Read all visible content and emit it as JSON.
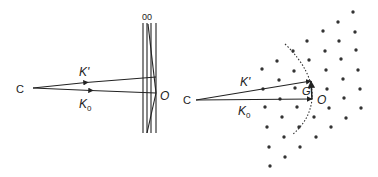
{
  "figure": {
    "left_panel": {
      "name": "real-space plane wave reflection",
      "labels": {
        "source": "C",
        "k_prime": "K'",
        "k_zero": "K",
        "k_zero_sub": "0",
        "origin": "O",
        "planes": "00"
      },
      "source_point": [
        33,
        88
      ],
      "k_prime_end": [
        156,
        77
      ],
      "k_zero_end": [
        156,
        93
      ],
      "vertical_planes_x": [
        143,
        147,
        151,
        156
      ],
      "planes_y_range": [
        23,
        133
      ]
    },
    "right_panel": {
      "name": "Ewald sphere construction in reciprocal lattice",
      "labels": {
        "source": "C",
        "k_prime": "K'",
        "k_zero": "K",
        "k_zero_sub": "0",
        "origin": "O",
        "g_vector": "G"
      },
      "source_point": [
        196,
        100
      ],
      "k_prime_end": [
        311,
        81
      ],
      "origin_point": [
        312,
        99
      ],
      "lattice_points": [
        [
          353,
          12
        ],
        [
          338,
          22
        ],
        [
          323,
          31
        ],
        [
          355,
          32
        ],
        [
          307,
          41
        ],
        [
          339,
          41
        ],
        [
          293,
          51
        ],
        [
          325,
          51
        ],
        [
          356,
          50
        ],
        [
          277,
          61
        ],
        [
          309,
          60
        ],
        [
          341,
          59
        ],
        [
          262,
          69
        ],
        [
          294,
          71
        ],
        [
          326,
          70
        ],
        [
          358,
          70
        ],
        [
          279,
          80
        ],
        [
          343,
          79
        ],
        [
          295,
          88
        ],
        [
          327,
          89
        ],
        [
          360,
          89
        ],
        [
          263,
          89
        ],
        [
          280,
          99
        ],
        [
          344,
          98
        ],
        [
          265,
          107
        ],
        [
          297,
          107
        ],
        [
          329,
          108
        ],
        [
          361,
          108
        ],
        [
          282,
          117
        ],
        [
          314,
          117
        ],
        [
          346,
          118
        ],
        [
          267,
          127
        ],
        [
          299,
          127
        ],
        [
          331,
          127
        ],
        [
          284,
          137
        ],
        [
          316,
          137
        ],
        [
          269,
          147
        ],
        [
          300,
          147
        ],
        [
          285,
          157
        ],
        [
          270,
          166
        ]
      ]
    }
  }
}
